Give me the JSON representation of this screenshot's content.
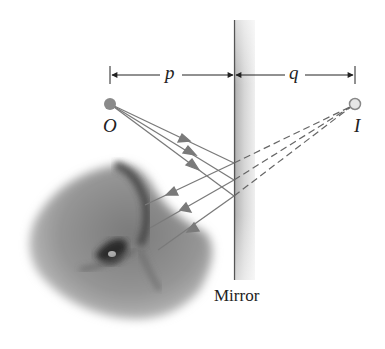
{
  "diagram": {
    "labels": {
      "object": "O",
      "image": "I",
      "object_distance": "p",
      "image_distance": "q",
      "mirror": "Mirror"
    },
    "colors": {
      "ray": "#7a7a7a",
      "object_point": "#8a8a8a",
      "image_point_fill": "#e6e6e6",
      "image_point_stroke": "#888888",
      "text": "#222222",
      "dimension_line": "#222222"
    },
    "geometry": {
      "object_point": [
        110,
        104
      ],
      "image_point": [
        355,
        104
      ],
      "mirror_x": [
        234,
        255
      ],
      "mirror_y": [
        20,
        280
      ],
      "reflection_points_y": [
        163,
        180,
        196
      ]
    },
    "elements": [
      "object point O with incident rays",
      "vertical flat mirror",
      "virtual image point I with dashed extension lines",
      "reflected rays toward eye",
      "eye illustration (photo)"
    ]
  }
}
